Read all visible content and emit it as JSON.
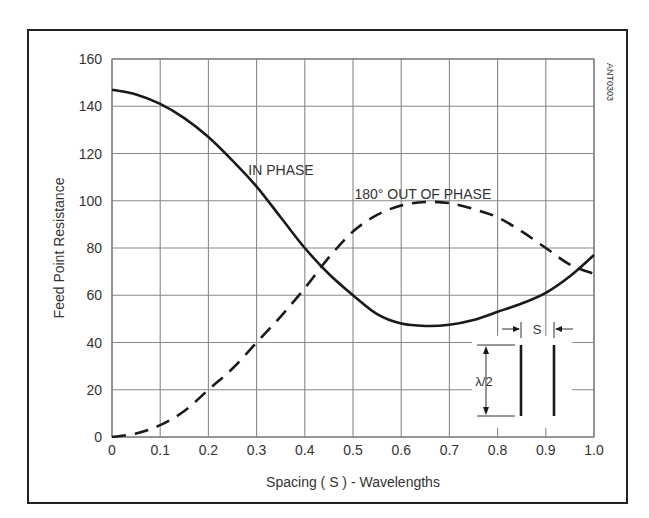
{
  "chart_data": {
    "type": "line",
    "title": "",
    "xlabel": "Spacing ( S ) - Wavelengths",
    "ylabel": "Feed Point Resistance",
    "xlim": [
      0,
      1.0
    ],
    "ylim": [
      0,
      160
    ],
    "grid": true,
    "x_ticks": [
      "0",
      "0.1",
      "0.2",
      "0.3",
      "0.4",
      "0.5",
      "0.6",
      "0.7",
      "0.8",
      "0.9",
      "1.0"
    ],
    "y_ticks": [
      "0",
      "20",
      "40",
      "60",
      "80",
      "100",
      "120",
      "140",
      "160"
    ],
    "x": [
      0,
      0.05,
      0.1,
      0.15,
      0.2,
      0.25,
      0.3,
      0.35,
      0.4,
      0.45,
      0.5,
      0.55,
      0.6,
      0.65,
      0.7,
      0.75,
      0.8,
      0.85,
      0.9,
      0.95,
      1.0
    ],
    "series": [
      {
        "name": "IN PHASE",
        "style": "solid",
        "values": [
          147,
          145,
          141,
          135,
          127,
          117,
          106,
          93,
          80,
          69,
          60,
          52,
          48,
          47,
          47.5,
          49.5,
          53,
          56.5,
          61,
          68,
          77
        ]
      },
      {
        "name": "180° OUT OF PHASE",
        "style": "dashed",
        "values": [
          0,
          1.5,
          5,
          11,
          20,
          29,
          40,
          51,
          63,
          76,
          87,
          94,
          98,
          99.5,
          99,
          96.5,
          93,
          87,
          80,
          73,
          69
        ]
      }
    ],
    "annotations": [
      {
        "text": "IN PHASE",
        "x": 0.285,
        "y": 113
      },
      {
        "text": "180° OUT OF PHASE",
        "x": 0.505,
        "y": 103
      },
      {
        "text": "ANT0303",
        "position": "top-right, rotated"
      }
    ],
    "inset": {
      "spacing_label": "S",
      "length_label": "λ/2"
    }
  }
}
